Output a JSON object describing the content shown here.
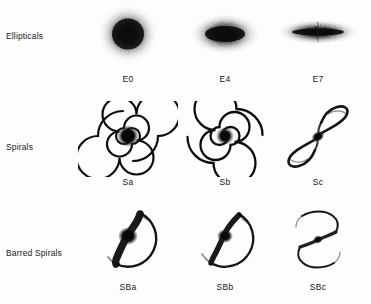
{
  "figure": {
    "background_color": "#fdfdfd",
    "ink_color": "#101010"
  },
  "rows": [
    {
      "id": "ellipticals",
      "label": "Ellipticals",
      "cells": [
        {
          "label": "E0",
          "shape": "elliptical-galaxy",
          "axis_ratio": 1.0
        },
        {
          "label": "E4",
          "shape": "elliptical-galaxy",
          "axis_ratio": 0.6
        },
        {
          "label": "E7",
          "shape": "elliptical-galaxy",
          "axis_ratio": 0.3
        }
      ]
    },
    {
      "id": "spirals",
      "label": "Spirals",
      "cells": [
        {
          "label": "Sa",
          "shape": "spiral-galaxy",
          "arm_winding": "tight",
          "bulge": "large"
        },
        {
          "label": "Sb",
          "shape": "spiral-galaxy",
          "arm_winding": "medium",
          "bulge": "medium"
        },
        {
          "label": "Sc",
          "shape": "spiral-galaxy",
          "arm_winding": "loose",
          "bulge": "small"
        }
      ]
    },
    {
      "id": "barred",
      "label": "Barred Spirals",
      "cells": [
        {
          "label": "SBa",
          "shape": "barred-spiral-galaxy",
          "arm_winding": "tight",
          "bulge": "large"
        },
        {
          "label": "SBb",
          "shape": "barred-spiral-galaxy",
          "arm_winding": "medium",
          "bulge": "medium"
        },
        {
          "label": "SBc",
          "shape": "barred-spiral-galaxy",
          "arm_winding": "loose",
          "bulge": "small"
        }
      ]
    }
  ]
}
